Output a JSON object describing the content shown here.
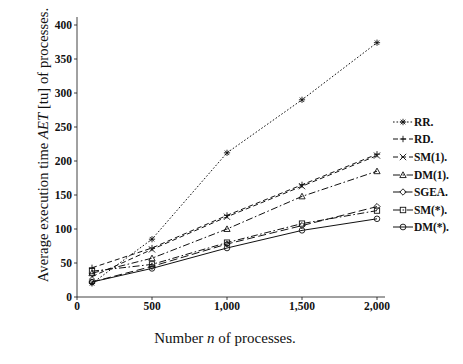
{
  "chart_data": {
    "type": "line",
    "title": "",
    "xlabel": "Number n of processes.",
    "ylabel": "Average execution time AET [tu] of processes.",
    "ylabel_parts": {
      "pre": "Average execution time ",
      "italic": "AET",
      "post": " [tu] of processes."
    },
    "xlabel_parts": {
      "pre": "Number ",
      "italic": "n",
      "post": " of processes."
    },
    "x": [
      100,
      500,
      1000,
      1500,
      2000
    ],
    "xlim": [
      0,
      2000
    ],
    "ylim": [
      0,
      400
    ],
    "xticks": [
      0,
      500,
      1000,
      1500,
      2000
    ],
    "xtick_labels": [
      "0",
      "500",
      "1,000",
      "1,500",
      "2,000"
    ],
    "yticks": [
      0,
      50,
      100,
      150,
      200,
      250,
      300,
      350,
      400
    ],
    "ytick_labels": [
      "0",
      "50",
      "100",
      "150",
      "200",
      "250",
      "300",
      "350",
      "400"
    ],
    "grid": false,
    "legend_position": "right",
    "series": [
      {
        "name": "RR.",
        "marker": "asterisk",
        "dash": "dotted",
        "values": [
          20,
          85,
          212,
          290,
          374
        ]
      },
      {
        "name": "RD.",
        "marker": "plus",
        "dash": "dashed",
        "values": [
          43,
          72,
          120,
          165,
          210
        ]
      },
      {
        "name": "SM(1).",
        "marker": "x",
        "dash": "dashed",
        "values": [
          30,
          70,
          118,
          163,
          208
        ]
      },
      {
        "name": "DM(1).",
        "marker": "triangle",
        "dash": "dashdot",
        "values": [
          35,
          57,
          100,
          148,
          185
        ]
      },
      {
        "name": "SGEA.",
        "marker": "diamond",
        "dash": "longdash",
        "values": [
          22,
          45,
          78,
          105,
          133
        ]
      },
      {
        "name": "SM(*).",
        "marker": "square",
        "dash": "dashdot",
        "values": [
          38,
          48,
          80,
          108,
          127
        ]
      },
      {
        "name": "DM(*).",
        "marker": "circle",
        "dash": "solid",
        "values": [
          22,
          42,
          72,
          98,
          115
        ]
      }
    ]
  },
  "legend": {
    "items": [
      {
        "label": "RR.",
        "marker": "asterisk-marker"
      },
      {
        "label": "RD.",
        "marker": "plus-marker"
      },
      {
        "label": "SM(1).",
        "marker": "x-marker"
      },
      {
        "label": "DM(1).",
        "marker": "triangle-marker"
      },
      {
        "label": "SGEA.",
        "marker": "diamond-marker"
      },
      {
        "label": "SM(*).",
        "marker": "square-marker"
      },
      {
        "label": "DM(*).",
        "marker": "circle-marker"
      }
    ]
  },
  "colors": {
    "ink": "#111111",
    "background": "#ffffff"
  }
}
